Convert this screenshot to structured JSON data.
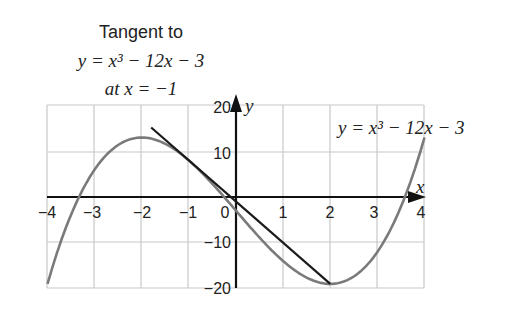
{
  "title": {
    "line1": "Tangent to",
    "line2": "y = x³ − 12x − 3",
    "line3": "at x = −1"
  },
  "curve_label": "y = x³ − 12x − 3",
  "axes": {
    "x_label": "x",
    "y_label": "y",
    "x_ticks": [
      "−4",
      "−3",
      "−2",
      "−1",
      "0",
      "1",
      "2",
      "3",
      "4"
    ],
    "y_ticks": [
      "20",
      "10",
      "−10",
      "−20"
    ]
  },
  "colors": {
    "curve": "#7a7a7a",
    "tangent": "#1a1a1a",
    "grid": "#c8c8c8",
    "axis": "#111111"
  },
  "chart_data": {
    "type": "line",
    "xlabel": "x",
    "ylabel": "y",
    "xlim": [
      -4,
      4
    ],
    "ylim": [
      -20,
      20
    ],
    "grid": true,
    "x_ticks": [
      -4,
      -3,
      -2,
      -1,
      0,
      1,
      2,
      3,
      4
    ],
    "y_ticks": [
      -20,
      -10,
      10,
      20
    ],
    "series": [
      {
        "name": "y = x³ − 12x − 3",
        "kind": "curve",
        "x": [
          -4,
          -3.5,
          -3,
          -2.5,
          -2,
          -1.5,
          -1,
          -0.5,
          0,
          0.5,
          1,
          1.5,
          2,
          2.5,
          3,
          3.5,
          4
        ],
        "y": [
          -19,
          -3.875,
          6,
          11.375,
          13,
          11.625,
          8,
          2.875,
          -3,
          -8.875,
          -14,
          -17.625,
          -19,
          -17.375,
          -12,
          -2.125,
          13
        ]
      },
      {
        "name": "Tangent at x = −1",
        "kind": "line",
        "equation": "y = −9x − 1",
        "x": [
          -1.8,
          2
        ],
        "y": [
          15.2,
          -19
        ]
      }
    ],
    "annotations": [
      {
        "text": "y = x³ − 12x − 3",
        "position": "upper right"
      },
      {
        "text": "Tangent to y = x³ − 12x − 3 at x = −1",
        "position": "upper left"
      }
    ]
  }
}
